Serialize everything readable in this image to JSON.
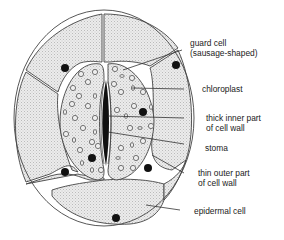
{
  "diagram": {
    "labels": [
      {
        "id": "guard-cell",
        "line1": "guard cell",
        "line2": "(sausage-shaped)"
      },
      {
        "id": "chloroplast",
        "line1": "chloroplast",
        "line2": ""
      },
      {
        "id": "thick-inner-wall",
        "line1": "thick inner part",
        "line2": "of cell wall"
      },
      {
        "id": "stoma",
        "line1": "stoma",
        "line2": ""
      },
      {
        "id": "thin-outer-wall",
        "line1": "thin outer part",
        "line2": "of cell wall"
      },
      {
        "id": "epidermal-cell",
        "line1": "epidermal cell",
        "line2": ""
      }
    ],
    "colors": {
      "cell_fill": "#e4e4e4",
      "outline": "#444444",
      "nucleus": "#111111",
      "background": "#ffffff"
    }
  }
}
